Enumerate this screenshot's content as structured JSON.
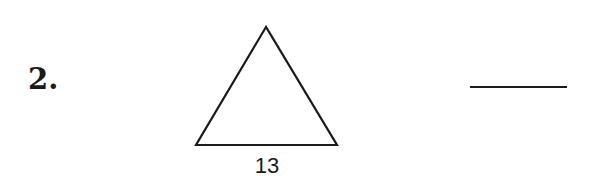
{
  "problem": {
    "number": "2.",
    "shape": "equilateral-triangle",
    "side_label": "13",
    "answer_blank": ""
  }
}
